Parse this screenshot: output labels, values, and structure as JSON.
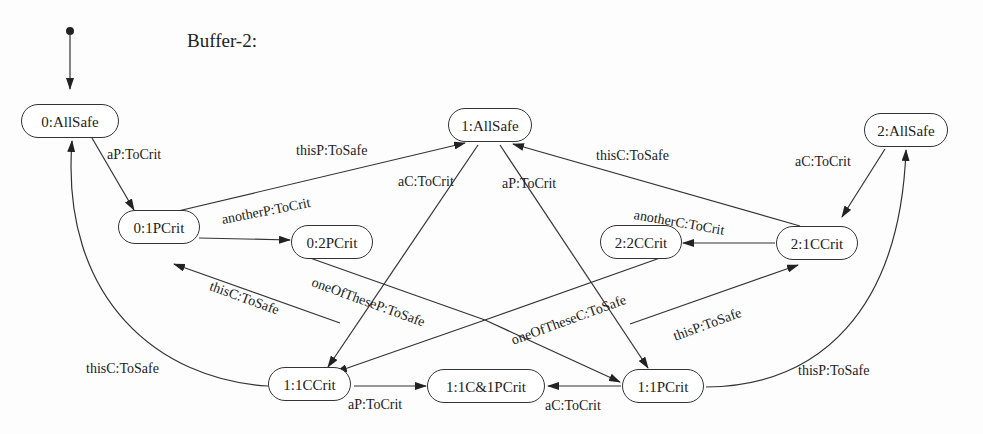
{
  "title": "Buffer-2:",
  "states": [
    {
      "id": "s0_allsafe",
      "label": "0:AllSafe"
    },
    {
      "id": "s1_allsafe",
      "label": "1:AllSafe"
    },
    {
      "id": "s2_allsafe",
      "label": "2:AllSafe"
    },
    {
      "id": "s0_1pcrit",
      "label": "0:1PCrit"
    },
    {
      "id": "s0_2pcrit",
      "label": "0:2PCrit"
    },
    {
      "id": "s2_2ccrit",
      "label": "2:2CCrit"
    },
    {
      "id": "s2_1ccrit",
      "label": "2:1CCrit"
    },
    {
      "id": "s1_1ccrit",
      "label": "1:1CCrit"
    },
    {
      "id": "s1_1c1pcrit",
      "label": "1:1C&1PCrit"
    },
    {
      "id": "s1_1pcrit",
      "label": "1:1PCrit"
    }
  ],
  "transitions": [
    {
      "from": "0:AllSafe",
      "to": "0:1PCrit",
      "label": "aP:ToCrit"
    },
    {
      "from": "0:1PCrit",
      "to": "1:AllSafe",
      "label": "thisP:ToSafe"
    },
    {
      "from": "1:AllSafe",
      "to": "1:1CCrit",
      "label": "aC:ToCrit"
    },
    {
      "from": "1:AllSafe",
      "to": "1:1PCrit",
      "label": "aP:ToCrit"
    },
    {
      "from": "2:1CCrit",
      "to": "1:AllSafe",
      "label": "thisC:ToSafe"
    },
    {
      "from": "2:AllSafe",
      "to": "2:1CCrit",
      "label": "aC:ToCrit"
    },
    {
      "from": "0:1PCrit",
      "to": "0:2PCrit",
      "label": "anotherP:ToCrit"
    },
    {
      "from": "2:1CCrit",
      "to": "2:2CCrit",
      "label": "anotherC:ToCrit"
    },
    {
      "from": "0:2PCrit",
      "to": "1:1PCrit",
      "label": "oneOfTheseP:ToSafe"
    },
    {
      "from": "2:2CCrit",
      "to": "1:1CCrit",
      "label": "oneOfTheseC:ToSafe"
    },
    {
      "from": "1:1C&1PCrit",
      "to": "0:1PCrit",
      "label": "thisC:ToSafe"
    },
    {
      "from": "1:1C&1PCrit",
      "to": "2:1CCrit",
      "label": "thisP:ToSafe"
    },
    {
      "from": "1:1CCrit",
      "to": "0:AllSafe",
      "label": "thisC:ToSafe"
    },
    {
      "from": "1:1PCrit",
      "to": "2:AllSafe",
      "label": "thisP:ToSafe"
    },
    {
      "from": "1:1CCrit",
      "to": "1:1C&1PCrit",
      "label": "aP:ToCrit"
    },
    {
      "from": "1:1PCrit",
      "to": "1:1C&1PCrit",
      "label": "aC:ToCrit"
    }
  ]
}
